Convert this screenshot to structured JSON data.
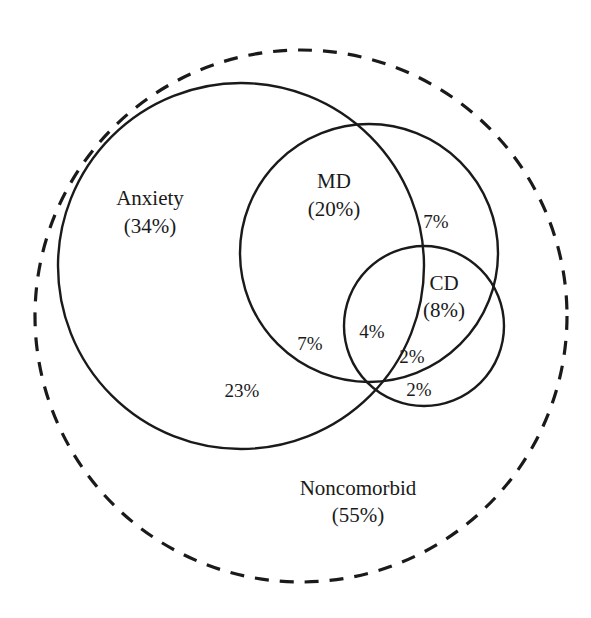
{
  "figure": {
    "type": "venn-diagram",
    "stroke_color": "#1a1a1a",
    "background_color": "#ffffff"
  },
  "sets": [
    {
      "id": "noncomorbid",
      "name": "Noncomorbid",
      "percent_label": "(55%)",
      "percent_value": 55,
      "stroke_style": "dashed",
      "cx": 301,
      "cy": 316,
      "r": 266,
      "label_x": 358,
      "label_y": 490,
      "pct_x": 358,
      "pct_y": 517
    },
    {
      "id": "anxiety",
      "name": "Anxiety",
      "percent_label": "(34%)",
      "percent_value": 34,
      "stroke_style": "solid",
      "cx": 241,
      "cy": 266,
      "r": 183,
      "label_x": 150,
      "label_y": 200,
      "pct_x": 150,
      "pct_y": 228
    },
    {
      "id": "md",
      "name": "MD",
      "percent_label": "(20%)",
      "percent_value": 20,
      "stroke_style": "solid",
      "cx": 369,
      "cy": 253,
      "r": 129,
      "label_x": 334,
      "label_y": 183,
      "pct_x": 334,
      "pct_y": 211
    },
    {
      "id": "cd",
      "name": "CD",
      "percent_label": "(8%)",
      "percent_value": 8,
      "stroke_style": "solid",
      "cx": 424,
      "cy": 326,
      "r": 80,
      "label_x": 444,
      "label_y": 285,
      "pct_x": 444,
      "pct_y": 312
    }
  ],
  "regions": [
    {
      "id": "md-only-outside-anxiety",
      "label": "7%",
      "value": 7,
      "x": 436,
      "y": 224
    },
    {
      "id": "anxiety-md-only",
      "label": "7%",
      "value": 7,
      "x": 310,
      "y": 346
    },
    {
      "id": "anxiety-md-cd",
      "label": "4%",
      "value": 4,
      "x": 372,
      "y": 334
    },
    {
      "id": "md-cd-only",
      "label": "2%",
      "value": 2,
      "x": 412,
      "y": 359
    },
    {
      "id": "anxiety-cd-only",
      "label": "2%",
      "value": 2,
      "x": 419,
      "y": 392
    },
    {
      "id": "anxiety-only",
      "label": "23%",
      "value": 23,
      "x": 242,
      "y": 393
    }
  ],
  "chart_data": {
    "type": "venn",
    "title": "",
    "unit": "percent",
    "sets": [
      {
        "name": "Anxiety",
        "percent": 34
      },
      {
        "name": "MD",
        "percent": 20
      },
      {
        "name": "CD",
        "percent": 8
      },
      {
        "name": "Noncomorbid",
        "percent": 55
      }
    ],
    "regions": [
      {
        "name": "Anxiety only",
        "percent": 23
      },
      {
        "name": "Anxiety and MD only",
        "percent": 7
      },
      {
        "name": "MD only (outside Anxiety)",
        "percent": 7
      },
      {
        "name": "Anxiety, MD and CD",
        "percent": 4
      },
      {
        "name": "MD and CD only",
        "percent": 2
      },
      {
        "name": "Anxiety and CD only",
        "percent": 2
      },
      {
        "name": "Noncomorbid",
        "percent": 55
      }
    ]
  }
}
